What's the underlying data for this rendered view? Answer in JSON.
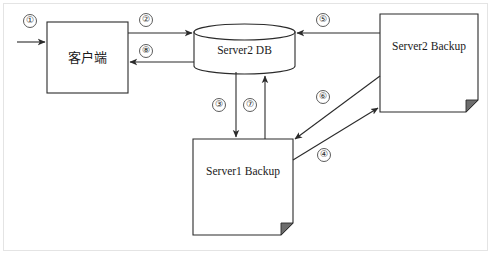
{
  "diagram": {
    "background_color": "#ffffff",
    "line_color": "#2b2b2b",
    "frame_color": "#e4e4e4",
    "nodes": [
      {
        "id": "client",
        "label": "客户端",
        "shape": "rectangle",
        "x": 47,
        "y": 22,
        "w": 81,
        "h": 71
      },
      {
        "id": "server2-db",
        "label": "Server2 DB",
        "shape": "cylinder",
        "x": 194,
        "y": 24,
        "w": 101,
        "h": 50
      },
      {
        "id": "server1-backup",
        "label": "Server1 Backup",
        "shape": "document",
        "x": 193,
        "y": 139,
        "w": 100,
        "h": 96
      },
      {
        "id": "server2-backup",
        "label": "Server2 Backup",
        "shape": "document",
        "x": 380,
        "y": 14,
        "w": 98,
        "h": 98
      }
    ],
    "connections": [
      {
        "id": "c1",
        "step": "①",
        "from": "external",
        "to": "client",
        "direction": "right",
        "label_x": 30,
        "label_y": 21
      },
      {
        "id": "c2",
        "step": "②",
        "from": "client",
        "to": "server2-db",
        "direction": "right",
        "label_x": 146,
        "label_y": 20
      },
      {
        "id": "c3",
        "step": "③",
        "from": "server2-db",
        "to": "server1-backup",
        "direction": "down",
        "label_x": 219,
        "label_y": 105
      },
      {
        "id": "c4",
        "step": "④",
        "from": "server1-backup",
        "to": "server2-backup",
        "direction": "up-right",
        "label_x": 324,
        "label_y": 155
      },
      {
        "id": "c5",
        "step": "⑤",
        "from": "server2-backup",
        "to": "server2-db",
        "direction": "left",
        "label_x": 323,
        "label_y": 20
      },
      {
        "id": "c6",
        "step": "⑥",
        "from": "server2-backup",
        "to": "server1-backup",
        "direction": "down-left",
        "label_x": 323,
        "label_y": 97
      },
      {
        "id": "c7",
        "step": "⑦",
        "from": "server1-backup",
        "to": "server2-db",
        "direction": "up",
        "label_x": 250,
        "label_y": 105
      },
      {
        "id": "c8",
        "step": "⑧",
        "from": "server2-db",
        "to": "client",
        "direction": "left",
        "label_x": 146,
        "label_y": 51
      }
    ]
  }
}
